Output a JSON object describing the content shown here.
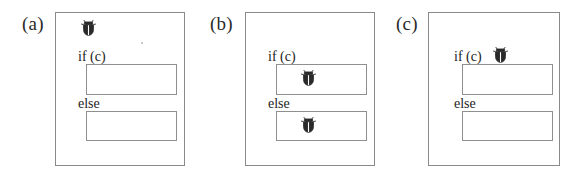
{
  "figure": {
    "background_color": "#ffffff",
    "line_color": "#8a8a8a",
    "text_color": "#232323",
    "icon_name": "bug-icon",
    "icon_color": "#2a2a2a"
  },
  "panels": [
    {
      "label": "(a)",
      "if_label": "if (c)",
      "else_label": "else",
      "bug_positions": [
        "above-if-statement"
      ]
    },
    {
      "label": "(b)",
      "if_label": "if (c)",
      "else_label": "else",
      "bug_positions": [
        "inside-then-block",
        "inside-else-block"
      ]
    },
    {
      "label": "(c)",
      "if_label": "if (c)",
      "else_label": "else",
      "bug_positions": [
        "on-if-condition"
      ]
    }
  ]
}
